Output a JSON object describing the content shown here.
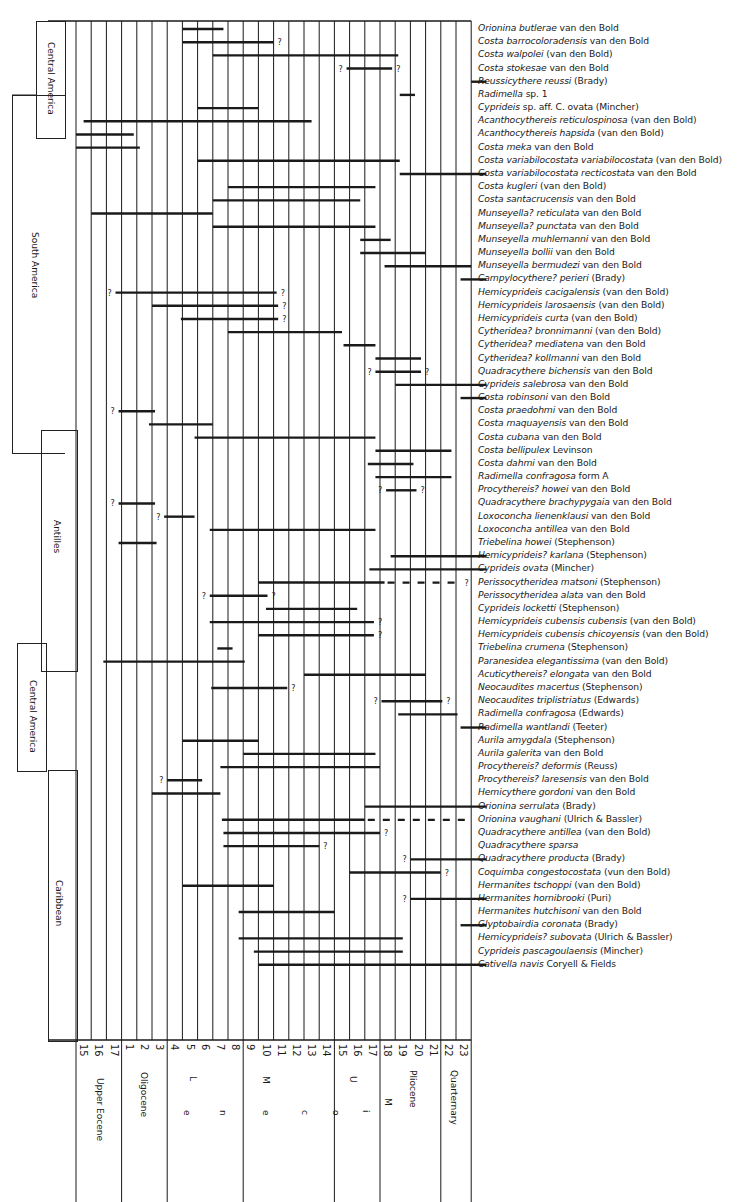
{
  "chart_data": {
    "type": "range-chart",
    "title": "",
    "xlabel": "Planktonic foraminiferal zones / Epochs",
    "ylabel": "Ostracode species",
    "zones": [
      "15",
      "16",
      "17",
      "1",
      "2",
      "3",
      "4",
      "5",
      "6",
      "7",
      "8",
      "9",
      "10",
      "11",
      "12",
      "13",
      "14",
      "15",
      "16",
      "17",
      "18",
      "19",
      "20",
      "21",
      "22",
      "23"
    ],
    "epochs": [
      {
        "label": "Upper Eocene",
        "from": 0,
        "to": 3
      },
      {
        "label": "Oligocene",
        "from": 3,
        "to": 6
      },
      {
        "label": "L",
        "sub": "e",
        "from": 6,
        "to": 11
      },
      {
        "label": "M",
        "sub": "n",
        "from": 11,
        "to": 17
      },
      {
        "label": "U",
        "sub": "e",
        "from": 17,
        "to": 20
      },
      {
        "label": "Pliocene",
        "from": 20,
        "to": 24
      },
      {
        "label": "Quarternary",
        "from": 24,
        "to": 26
      }
    ],
    "miocene_letters": [
      "M",
      "i",
      "o",
      "c",
      "e",
      "n",
      "e"
    ],
    "regions": [
      {
        "label": "Central America",
        "row_from": 0,
        "row_to": 8
      },
      {
        "label": "South America",
        "row_from": 8,
        "row_to": 28
      },
      {
        "label": "Antilles",
        "row_from": 29,
        "row_to": 48
      },
      {
        "label": "Central America",
        "row_from": 48,
        "row_to": 56
      },
      {
        "label": "Caribbean",
        "row_from": 56,
        "row_to": 73
      }
    ],
    "species": [
      {
        "genus": "Orionina",
        "epithet": "butlerae",
        "author": "van den Bold",
        "bars": [
          [
            7,
            9.7
          ]
        ]
      },
      {
        "genus": "Costa",
        "epithet": "barrocoloradensis",
        "author": "van den Bold",
        "bars": [
          [
            7,
            13
          ]
        ],
        "q_end": true
      },
      {
        "genus": "Costa",
        "epithet": "walpolei",
        "author": "(van den Bold)",
        "bars": [
          [
            9,
            21.2
          ]
        ]
      },
      {
        "genus": "Costa",
        "epithet": "stokesae",
        "author": "van den Bold",
        "bars": [
          [
            17.8,
            20.8
          ]
        ],
        "q_start": true,
        "q_end": true
      },
      {
        "genus": "Reussicythere",
        "epithet": "reussi",
        "author": "(Brady)",
        "bars": [
          [
            26,
            27
          ]
        ]
      },
      {
        "genus": "Radimella",
        "epithet": "sp. 1",
        "author": "",
        "bars": [
          [
            21.3,
            22.3
          ]
        ]
      },
      {
        "genus": "Cyprideis",
        "epithet": "sp. aff. C. ovata",
        "author": "(Mincher)",
        "bars": [
          [
            8,
            12
          ]
        ]
      },
      {
        "genus": "Acanthocythereis",
        "epithet": "reticulospinosa",
        "author": "(van den Bold)",
        "bars": [
          [
            0.5,
            15.5
          ]
        ]
      },
      {
        "genus": "Acanthocythereis",
        "epithet": "hapsida",
        "author": "(van den Bold)",
        "bars": [
          [
            0,
            3.8
          ]
        ]
      },
      {
        "genus": "Costa",
        "epithet": "meka",
        "author": "van den Bold",
        "bars": [
          [
            0,
            4.2
          ]
        ]
      },
      {
        "genus": "Costa",
        "epithet": "variabilocostata variabilocostata",
        "author": "(van den Bold)",
        "bars": [
          [
            8,
            21.3
          ]
        ]
      },
      {
        "genus": "Costa",
        "epithet": "variabilocostata recticostata",
        "author": "van den Bold",
        "bars": [
          [
            21.3,
            27
          ]
        ]
      },
      {
        "genus": "Costa",
        "epithet": "kugleri",
        "author": "(van den Bold)",
        "bars": [
          [
            10,
            19.7
          ]
        ]
      },
      {
        "genus": "Costa",
        "epithet": "santacrucensis",
        "author": "van den Bold",
        "bars": [
          [
            9,
            18.7
          ]
        ]
      },
      {
        "genus": "Munseyella?",
        "epithet": "reticulata",
        "author": "van den Bold",
        "bars": [
          [
            1,
            9
          ]
        ]
      },
      {
        "genus": "Munseyella?",
        "epithet": "punctata",
        "author": "van den Bold",
        "bars": [
          [
            9,
            19.7
          ]
        ]
      },
      {
        "genus": "Munseyella",
        "epithet": "muhlemanni",
        "author": "van den Bold",
        "bars": [
          [
            18.7,
            20.7
          ]
        ]
      },
      {
        "genus": "Munseyella",
        "epithet": "bollii",
        "author": "van den Bold",
        "bars": [
          [
            18.7,
            23
          ]
        ]
      },
      {
        "genus": "Munseyella",
        "epithet": "bermudezi",
        "author": "van den Bold",
        "bars": [
          [
            20.3,
            26
          ]
        ]
      },
      {
        "genus": "Campylocythere?",
        "epithet": "perieri",
        "author": "(Brady)",
        "bars": [
          [
            25.3,
            27
          ]
        ]
      },
      {
        "genus": "Hemicyprideis",
        "epithet": "cacigalensis",
        "author": "(van den Bold)",
        "bars": [
          [
            2.6,
            13.2
          ]
        ],
        "q_start": true,
        "q_end": true
      },
      {
        "genus": "Hemicyprideis",
        "epithet": "larosaensis",
        "author": "(van den Bold)",
        "bars": [
          [
            5,
            13.3
          ]
        ],
        "q_end": true
      },
      {
        "genus": "Hemicyprideis",
        "epithet": "curta",
        "author": "(van den Bold)",
        "bars": [
          [
            6.9,
            13.3
          ]
        ],
        "q_end": true
      },
      {
        "genus": "Cytheridea?",
        "epithet": "bronnimanni",
        "author": "(van den Bold)",
        "bars": [
          [
            10,
            17.5
          ]
        ]
      },
      {
        "genus": "Cytheridea?",
        "epithet": "mediatena",
        "author": "van den Bold",
        "bars": [
          [
            17.6,
            19.7
          ]
        ]
      },
      {
        "genus": "Cytheridea?",
        "epithet": "kollmanni",
        "author": "van den Bold",
        "bars": [
          [
            19.7,
            22.7
          ]
        ]
      },
      {
        "genus": "Quadracythere",
        "epithet": "bichensis",
        "author": "van den Bold",
        "bars": [
          [
            19.7,
            22.7
          ]
        ],
        "q_start": true,
        "q_end": true
      },
      {
        "genus": "Cyprideis",
        "epithet": "salebrosa",
        "author": "van den Bold",
        "bars": [
          [
            21,
            27
          ]
        ]
      },
      {
        "genus": "Costa",
        "epithet": "robinsoni",
        "author": "van den Bold",
        "bars": [
          [
            25.3,
            27
          ]
        ]
      },
      {
        "genus": "Costa",
        "epithet": "praedohmi",
        "author": "van den Bold",
        "bars": [
          [
            2.8,
            5.2
          ]
        ],
        "q_start": true
      },
      {
        "genus": "Costa",
        "epithet": "maquayensis",
        "author": "van den Bold",
        "bars": [
          [
            4.8,
            9
          ]
        ]
      },
      {
        "genus": "Costa",
        "epithet": "cubana",
        "author": "van den Bold",
        "bars": [
          [
            7.8,
            19.7
          ]
        ]
      },
      {
        "genus": "Costa",
        "epithet": "bellipulex",
        "author": "Levinson",
        "bars": [
          [
            19.7,
            24.7
          ]
        ]
      },
      {
        "genus": "Costa",
        "epithet": "dahmi",
        "author": "van den Bold",
        "bars": [
          [
            19.2,
            22.2
          ]
        ]
      },
      {
        "genus": "Radimella",
        "epithet": "confragosa form A",
        "author": "",
        "bars": [
          [
            19.7,
            24.7
          ]
        ]
      },
      {
        "genus": "Procythereis?",
        "epithet": "howei",
        "author": "van den Bold",
        "bars": [
          [
            20.4,
            22.4
          ]
        ],
        "q_start": true,
        "q_end": true
      },
      {
        "genus": "Quadracythere",
        "epithet": "brachypygaia",
        "author": "van den Bold",
        "bars": [
          [
            2.8,
            5.2
          ]
        ],
        "q_start": true
      },
      {
        "genus": "Loxoconcha",
        "epithet": "lienenklausi",
        "author": "van den Bold",
        "bars": [
          [
            5.8,
            7.8
          ]
        ],
        "q_start": true
      },
      {
        "genus": "Loxoconcha",
        "epithet": "antillea",
        "author": "van den Bold",
        "bars": [
          [
            8.8,
            19.7
          ]
        ]
      },
      {
        "genus": "Triebelina",
        "epithet": "howei",
        "author": "(Stephenson)",
        "bars": [
          [
            2.8,
            5.3
          ]
        ]
      },
      {
        "genus": "Hemicyprideis?",
        "epithet": "karlana",
        "author": "(Stephenson)",
        "bars": [
          [
            20.7,
            27
          ]
        ]
      },
      {
        "genus": "Cyprideis",
        "epithet": "ovata",
        "author": "(Mincher)",
        "bars": [
          [
            19.3,
            27
          ]
        ]
      },
      {
        "genus": "Perissocytheridea",
        "epithet": "matsoni",
        "author": "(Stephenson)",
        "bars": [
          [
            12,
            20.3
          ]
        ],
        "dashed_to": 25.3,
        "q_end": true
      },
      {
        "genus": "Perissocytheridea",
        "epithet": "alata",
        "author": "van den Bold",
        "bars": [
          [
            8.8,
            12.6
          ]
        ],
        "q_start": true,
        "q_end": true
      },
      {
        "genus": "Cyprideis",
        "epithet": "locketti",
        "author": "(Stephenson)",
        "bars": [
          [
            12.5,
            18.5
          ]
        ]
      },
      {
        "genus": "Hemicyprideis",
        "epithet": "cubensis cubensis",
        "author": "(van den Bold)",
        "bars": [
          [
            8.8,
            19.6
          ]
        ],
        "q_end": true
      },
      {
        "genus": "Hemicyprideis",
        "epithet": "cubensis chicoyensis",
        "author": "(van den Bold)",
        "bars": [
          [
            12,
            19.6
          ]
        ],
        "q_end": true
      },
      {
        "genus": "Triebelina",
        "epithet": "crumena",
        "author": "(Stephenson)",
        "bars": [
          [
            9.3,
            10.3
          ]
        ]
      },
      {
        "genus": "Paranesidea",
        "epithet": "elegantissima",
        "author": "(van den Bold)",
        "bars": [
          [
            1.8,
            11.1
          ]
        ]
      },
      {
        "genus": "Acuticythereis?",
        "epithet": "elongata",
        "author": "van den Bold",
        "bars": [
          [
            15,
            23
          ]
        ]
      },
      {
        "genus": "Neocaudites",
        "epithet": "macertus",
        "author": "(Stephenson)",
        "bars": [
          [
            8.9,
            13.9
          ]
        ],
        "q_end": true
      },
      {
        "genus": "Neocaudites",
        "epithet": "triplistriatus",
        "author": "(Edwards)",
        "bars": [
          [
            20.1,
            24.1
          ]
        ],
        "q_start": true,
        "q_end": true
      },
      {
        "genus": "Radimella",
        "epithet": "confragosa",
        "author": "(Edwards)",
        "bars": [
          [
            21.2,
            25.1
          ]
        ]
      },
      {
        "genus": "Radimella",
        "epithet": "wantlandi",
        "author": "(Teeter)",
        "bars": [
          [
            25.3,
            27
          ]
        ]
      },
      {
        "genus": "Aurila",
        "epithet": "amygdala",
        "author": "(Stephenson)",
        "bars": [
          [
            7,
            12
          ]
        ]
      },
      {
        "genus": "Aurila",
        "epithet": "galerita",
        "author": "van den Bold",
        "bars": [
          [
            11,
            19.7
          ]
        ]
      },
      {
        "genus": "Procythereis?",
        "epithet": "deformis",
        "author": "(Reuss)",
        "bars": [
          [
            9.5,
            20
          ]
        ]
      },
      {
        "genus": "Procythereis?",
        "epithet": "laresensis",
        "author": "van den Bold",
        "bars": [
          [
            6,
            8.3
          ]
        ],
        "q_start": true
      },
      {
        "genus": "Hemicythere",
        "epithet": "gordoni",
        "author": "van den Bold",
        "bars": [
          [
            5,
            9.5
          ]
        ]
      },
      {
        "genus": "Orionina",
        "epithet": "serrulata",
        "author": "(Brady)",
        "bars": [
          [
            19,
            27
          ]
        ]
      },
      {
        "genus": "Orionina",
        "epithet": "vaughani",
        "author": "(Ulrich & Bassler)",
        "bars": [
          [
            9.6,
            19
          ]
        ],
        "dashed_to": 25.9
      },
      {
        "genus": "Quadracythere",
        "epithet": "antillea",
        "author": "(van den Bold)",
        "bars": [
          [
            9.7,
            20
          ]
        ],
        "q_end": true
      },
      {
        "genus": "Quadracythere",
        "epithet": "sparsa",
        "author": "",
        "bars": [
          [
            9.7,
            16
          ]
        ],
        "q_end": true
      },
      {
        "genus": "Quadracythere",
        "epithet": "producta",
        "author": "(Brady)",
        "bars": [
          [
            22,
            27
          ]
        ],
        "q_start": true
      },
      {
        "genus": "Coquimba",
        "epithet": "congestocostata",
        "author": "(vun den Bold)",
        "bars": [
          [
            18,
            24
          ]
        ],
        "q_end": true
      },
      {
        "genus": "Hermanites",
        "epithet": "tschoppi",
        "author": "(van den Bold)",
        "bars": [
          [
            7,
            13
          ]
        ]
      },
      {
        "genus": "Hermanites",
        "epithet": "hornibrooki",
        "author": "(Puri)",
        "bars": [
          [
            22,
            27
          ]
        ],
        "q_start": true
      },
      {
        "genus": "Hermanites",
        "epithet": "hutchisoni",
        "author": "van den Bold",
        "bars": [
          [
            10.7,
            17
          ]
        ]
      },
      {
        "genus": "Glyptobairdia",
        "epithet": "coronata",
        "author": "(Brady)",
        "bars": [
          [
            25.3,
            27
          ]
        ]
      },
      {
        "genus": "Hemicyprideis?",
        "epithet": "subovata",
        "author": "(Ulrich & Bassler)",
        "bars": [
          [
            10.7,
            21.5
          ]
        ]
      },
      {
        "genus": "Cyprideis",
        "epithet": "pascagoulaensis",
        "author": "(Mincher)",
        "bars": [
          [
            11.7,
            21.5
          ]
        ]
      },
      {
        "genus": "Cativella",
        "epithet": "navis",
        "author": "Coryell & Fields",
        "bars": [
          [
            12,
            27
          ]
        ]
      }
    ],
    "grid": true,
    "legend": "none"
  }
}
